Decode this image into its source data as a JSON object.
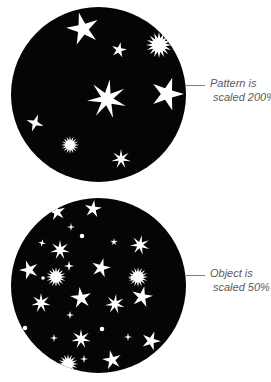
{
  "figure": {
    "background_color": "#ffffff",
    "disc_color": "#050505",
    "star_color": "#ffffff",
    "caption_color": "#5a5a5a",
    "leader_color": "#808080"
  },
  "panels": [
    {
      "id": "pattern-scaled-200",
      "callout": {
        "line1": "Pattern is",
        "line2": "scaled 200%"
      },
      "stars": [
        {
          "cx": 72,
          "cy": 22,
          "points": 5,
          "r": 17,
          "inner": 0.34,
          "rot": -14,
          "kind": "star"
        },
        {
          "cx": 108,
          "cy": 43,
          "points": 5,
          "r": 8,
          "inner": 0.34,
          "rot": 12,
          "kind": "star"
        },
        {
          "cx": 148,
          "cy": 38,
          "points": 16,
          "r": 13,
          "inner": 0.52,
          "rot": 0,
          "kind": "burst"
        },
        {
          "cx": 96,
          "cy": 92,
          "points": 7,
          "r": 20,
          "inner": 0.32,
          "rot": 8,
          "kind": "star"
        },
        {
          "cx": 156,
          "cy": 87,
          "points": 5,
          "r": 17,
          "inner": 0.36,
          "rot": 18,
          "kind": "star"
        },
        {
          "cx": 24,
          "cy": 116,
          "points": 4,
          "r": 9,
          "inner": 0.3,
          "rot": 20,
          "kind": "star"
        },
        {
          "cx": 59,
          "cy": 138,
          "points": 16,
          "r": 9,
          "inner": 0.5,
          "rot": 0,
          "kind": "burst"
        },
        {
          "cx": 110,
          "cy": 152,
          "points": 7,
          "r": 10,
          "inner": 0.3,
          "rot": 0,
          "kind": "star"
        },
        {
          "cx": 164,
          "cy": 150,
          "points": 5,
          "r": 12,
          "inner": 0.34,
          "rot": -25,
          "kind": "star"
        }
      ]
    },
    {
      "id": "object-scaled-50",
      "callout": {
        "line1": "Object is",
        "line2": "scaled 50%"
      },
      "stars": [
        {
          "cx": 46,
          "cy": 14,
          "points": 5,
          "r": 9,
          "inner": 0.34,
          "rot": -10,
          "kind": "star"
        },
        {
          "cx": 82,
          "cy": 11,
          "points": 5,
          "r": 9,
          "inner": 0.34,
          "rot": 8,
          "kind": "star"
        },
        {
          "cx": 60,
          "cy": 29,
          "points": 4,
          "r": 4,
          "inner": 0.28,
          "rot": 0,
          "kind": "star"
        },
        {
          "cx": 31,
          "cy": 45,
          "points": 4,
          "r": 4,
          "inner": 0.3,
          "rot": 15,
          "kind": "star"
        },
        {
          "cx": 71,
          "cy": 38,
          "points": 4,
          "r": 5,
          "inner": 0.95,
          "rot": 0,
          "kind": "dot"
        },
        {
          "cx": 103,
          "cy": 44,
          "points": 5,
          "r": 4,
          "inner": 0.32,
          "rot": 0,
          "kind": "star"
        },
        {
          "cx": 49,
          "cy": 52,
          "points": 7,
          "r": 10,
          "inner": 0.32,
          "rot": 0,
          "kind": "star"
        },
        {
          "cx": 129,
          "cy": 47,
          "points": 7,
          "r": 10,
          "inner": 0.32,
          "rot": 10,
          "kind": "star"
        },
        {
          "cx": 18,
          "cy": 72,
          "points": 5,
          "r": 10,
          "inner": 0.34,
          "rot": -18,
          "kind": "star"
        },
        {
          "cx": 58,
          "cy": 68,
          "points": 4,
          "r": 5,
          "inner": 0.3,
          "rot": 0,
          "kind": "star"
        },
        {
          "cx": 90,
          "cy": 70,
          "points": 5,
          "r": 10,
          "inner": 0.34,
          "rot": 14,
          "kind": "star"
        },
        {
          "cx": 121,
          "cy": 80,
          "points": 4,
          "r": 4,
          "inner": 0.3,
          "rot": 0,
          "kind": "star"
        },
        {
          "cx": 45,
          "cy": 79,
          "points": 16,
          "r": 10,
          "inner": 0.5,
          "rot": 0,
          "kind": "burst"
        },
        {
          "cx": 127,
          "cy": 79,
          "points": 16,
          "r": 10,
          "inner": 0.5,
          "rot": 0,
          "kind": "burst"
        },
        {
          "cx": 32,
          "cy": 80,
          "points": 4,
          "r": 4,
          "inner": 0.95,
          "rot": 0,
          "kind": "dot"
        },
        {
          "cx": 30,
          "cy": 105,
          "points": 7,
          "r": 10,
          "inner": 0.32,
          "rot": 0,
          "kind": "star"
        },
        {
          "cx": 70,
          "cy": 100,
          "points": 5,
          "r": 11,
          "inner": 0.34,
          "rot": -8,
          "kind": "star"
        },
        {
          "cx": 104,
          "cy": 106,
          "points": 7,
          "r": 10,
          "inner": 0.32,
          "rot": 6,
          "kind": "star"
        },
        {
          "cx": 131,
          "cy": 99,
          "points": 5,
          "r": 11,
          "inner": 0.34,
          "rot": 12,
          "kind": "star"
        },
        {
          "cx": 59,
          "cy": 117,
          "points": 4,
          "r": 4,
          "inner": 0.3,
          "rot": 0,
          "kind": "star"
        },
        {
          "cx": 14,
          "cy": 130,
          "points": 4,
          "r": 5,
          "inner": 0.95,
          "rot": 0,
          "kind": "dot"
        },
        {
          "cx": 91,
          "cy": 131,
          "points": 4,
          "r": 5,
          "inner": 0.95,
          "rot": 0,
          "kind": "dot"
        },
        {
          "cx": 43,
          "cy": 140,
          "points": 4,
          "r": 4,
          "inner": 0.3,
          "rot": 0,
          "kind": "star"
        },
        {
          "cx": 117,
          "cy": 139,
          "points": 4,
          "r": 4,
          "inner": 0.3,
          "rot": 0,
          "kind": "star"
        },
        {
          "cx": 70,
          "cy": 141,
          "points": 7,
          "r": 10,
          "inner": 0.32,
          "rot": 0,
          "kind": "star"
        },
        {
          "cx": 140,
          "cy": 143,
          "points": 5,
          "r": 10,
          "inner": 0.34,
          "rot": 20,
          "kind": "star"
        },
        {
          "cx": 73,
          "cy": 161,
          "points": 4,
          "r": 4,
          "inner": 0.3,
          "rot": 0,
          "kind": "star"
        },
        {
          "cx": 57,
          "cy": 166,
          "points": 16,
          "r": 10,
          "inner": 0.5,
          "rot": 0,
          "kind": "burst"
        },
        {
          "cx": 101,
          "cy": 162,
          "points": 5,
          "r": 10,
          "inner": 0.34,
          "rot": -12,
          "kind": "star"
        },
        {
          "cx": 116,
          "cy": 176,
          "points": 4,
          "r": 4,
          "inner": 0.3,
          "rot": 0,
          "kind": "star"
        }
      ]
    }
  ]
}
